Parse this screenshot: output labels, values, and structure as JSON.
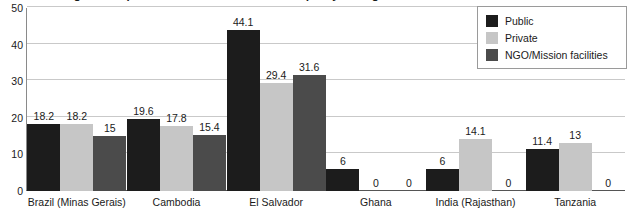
{
  "chart_data": {
    "type": "bar",
    "title": "Percentage of sampled tracer medicines that failed quality testing",
    "xlabel": "",
    "ylabel": "",
    "ylim": [
      0,
      50
    ],
    "yticks": [
      0,
      10,
      20,
      30,
      40,
      50
    ],
    "grid": true,
    "legend_position": "top-right",
    "categories": [
      "Brazil (Minas Gerais)",
      "Cambodia",
      "El Salvador",
      "Ghana",
      "India (Rajasthan)",
      "Tanzania"
    ],
    "series": [
      {
        "name": "Public",
        "color": "#1c1c1c",
        "values": [
          18.2,
          19.6,
          44.1,
          6,
          6,
          11.4
        ],
        "labels": [
          "18.2",
          "19.6",
          "44.1",
          "6",
          "6",
          "11.4"
        ]
      },
      {
        "name": "Private",
        "color": "#c6c6c6",
        "values": [
          18.2,
          17.8,
          29.4,
          0,
          14.1,
          13
        ],
        "labels": [
          "18.2",
          "17.8",
          "29.4",
          "0",
          "14.1",
          "13"
        ]
      },
      {
        "name": "NGO/Mission facilities",
        "color": "#4b4b4b",
        "values": [
          15,
          15.4,
          31.6,
          0,
          0,
          0
        ],
        "labels": [
          "15",
          "15.4",
          "31.6",
          "0",
          "0",
          "0"
        ]
      }
    ]
  },
  "colors": {
    "public": "#1c1c1c",
    "private": "#c6c6c6",
    "ngo": "#4b4b4b",
    "gridline": "#c9c9c9",
    "axis": "#555555",
    "text": "#1a1a1a"
  }
}
